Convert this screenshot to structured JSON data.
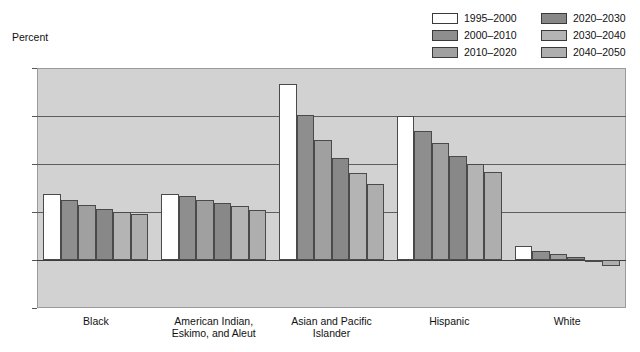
{
  "axis_title": "Percent",
  "legend": {
    "left": [
      {
        "label": "1995–2000",
        "color": "#ffffff"
      },
      {
        "label": "2000–2010",
        "color": "#8e8e8e"
      },
      {
        "label": "2010–2020",
        "color": "#a0a0a0"
      }
    ],
    "right": [
      {
        "label": "2020–2030",
        "color": "#888888"
      },
      {
        "label": "2030–2040",
        "color": "#b4b4b4"
      },
      {
        "label": "2040–2050",
        "color": "#aeaeae"
      }
    ]
  },
  "chart_data": {
    "type": "bar",
    "title": "",
    "xlabel": "",
    "ylabel": "Percent",
    "ylim": [
      -1,
      4
    ],
    "yticks": [
      4,
      3,
      2,
      1,
      0,
      -1
    ],
    "ytick_labels": [
      "4",
      "3",
      "2",
      "1",
      "0",
      "–1"
    ],
    "grid": true,
    "legend_position": "top-right",
    "categories": [
      "Black",
      "American Indian,\nEskimo, and Aleut",
      "Asian and Pacific\nIslander",
      "Hispanic",
      "White"
    ],
    "series": [
      {
        "name": "1995–2000",
        "color": "#ffffff",
        "values": [
          1.38,
          1.38,
          3.67,
          3.0,
          0.3
        ]
      },
      {
        "name": "2000–2010",
        "color": "#8e8e8e",
        "values": [
          1.25,
          1.33,
          3.02,
          2.68,
          0.19
        ]
      },
      {
        "name": "2010–2020",
        "color": "#a0a0a0",
        "values": [
          1.15,
          1.25,
          2.5,
          2.44,
          0.13
        ]
      },
      {
        "name": "2020–2030",
        "color": "#888888",
        "values": [
          1.06,
          1.19,
          2.12,
          2.16,
          0.06
        ]
      },
      {
        "name": "2030–2040",
        "color": "#b4b4b4",
        "values": [
          1.0,
          1.13,
          1.82,
          2.0,
          -0.05
        ]
      },
      {
        "name": "2040–2050",
        "color": "#aeaeae",
        "values": [
          0.96,
          1.04,
          1.58,
          1.83,
          -0.12
        ]
      }
    ]
  }
}
